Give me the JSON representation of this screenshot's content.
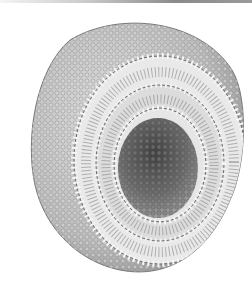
{
  "image": {
    "subject": "liposome cross-section illustration",
    "description": "Grayscale cutaway of a spherical lipid bilayer vesicle showing phospholipid heads and tails with a hollow aqueous core",
    "colors": {
      "background": "#ffffff",
      "surface": "#cfcfcf",
      "head": "#e6e6e6",
      "outline": "#555555",
      "core": "#6a6a6a"
    }
  }
}
